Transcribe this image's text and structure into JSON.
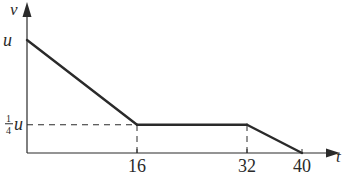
{
  "chart_data": {
    "type": "line",
    "title": "",
    "xlabel": "t",
    "ylabel": "v",
    "x": [
      0,
      16,
      32,
      40
    ],
    "series": [
      {
        "name": "velocity",
        "values": [
          1,
          0.25,
          0.25,
          0
        ]
      }
    ],
    "xticks": [
      {
        "value": 16,
        "label": "16"
      },
      {
        "value": 32,
        "label": "32"
      },
      {
        "value": 40,
        "label": "40"
      }
    ],
    "yticks": [
      {
        "value": 1,
        "label": "u"
      },
      {
        "value": 0.25,
        "label_num": "1",
        "label_den": "4",
        "label_var": "u"
      }
    ],
    "xlim": [
      0,
      40
    ],
    "ylim": [
      0,
      1
    ],
    "y_unit": "u",
    "grid": false,
    "legend": "none",
    "guides": [
      {
        "type": "horizontal-dashed",
        "y": 0.25,
        "from_x": 0,
        "to_x": 16
      },
      {
        "type": "vertical-dashed",
        "x": 16,
        "from_y": 0,
        "to_y": 0.25
      },
      {
        "type": "vertical-dashed",
        "x": 32,
        "from_y": 0,
        "to_y": 0.25
      }
    ],
    "colors": {
      "ink": "#2a2a2a"
    }
  }
}
